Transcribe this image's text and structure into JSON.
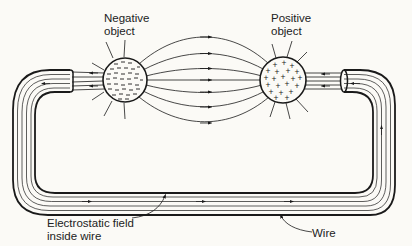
{
  "diagram": {
    "labels": {
      "negative_object": "Negative\nobject",
      "positive_object": "Positive\nobject",
      "field_inside_wire": "Electrostatic field\ninside wire",
      "wire": "Wire"
    },
    "objects": [
      {
        "name": "negative-object",
        "charge": "-",
        "cx": 125,
        "cy": 80,
        "r": 22
      },
      {
        "name": "positive-object",
        "charge": "+",
        "cx": 283,
        "cy": 80,
        "r": 23
      }
    ],
    "colors": {
      "ink": "#1a1a1a",
      "background": "#fbfaf6"
    }
  }
}
